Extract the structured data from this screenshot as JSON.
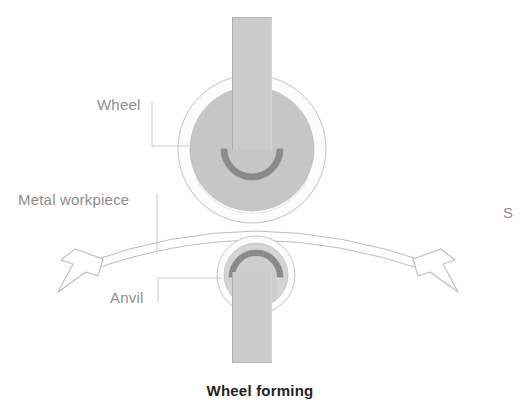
{
  "figure": {
    "caption": "Wheel forming",
    "background_color": "#ffffff"
  },
  "labels": {
    "wheel": "Wheel",
    "metal_workpiece": "Metal workpiece",
    "anvil": "Anvil",
    "cutoff_right_edge": "S"
  },
  "colors": {
    "label_text": "#8d8d8d",
    "caption_text": "#231f20",
    "outline_stroke": "#b5b5b5",
    "disc_fill": "#c6c6c6",
    "dark_ring": "#8a8a8a",
    "shaft_fill": "#cbcbcb",
    "shaft_edge": "#b0b0b0",
    "halo_fill": "#fbfbfb",
    "workpiece_fill": "#ffffff",
    "arrow_fill": "#ffffff"
  },
  "parts": [
    {
      "name": "wheel",
      "type": "roller",
      "center": [
        252,
        149
      ],
      "outer_radius": 74,
      "disc_radius": 62,
      "hub_ring_outer_radius": 31,
      "hub_ring_inner_radius": 25,
      "hub_ring_opening": "top",
      "shaft": {
        "x": 232,
        "y_top": 17,
        "width": 40,
        "y_bottom": 149
      }
    },
    {
      "name": "anvil",
      "type": "roller",
      "center": [
        256,
        275
      ],
      "outer_radius": 39,
      "disc_radius": 32,
      "hub_ring_outer_radius": 27,
      "hub_ring_inner_radius": 21,
      "hub_ring_opening": "bottom",
      "shaft": {
        "x": 232,
        "y_top": 275,
        "width": 40,
        "y_bottom": 363
      }
    },
    {
      "name": "metal-workpiece",
      "type": "curved-strip",
      "left_end": [
        84,
        262
      ],
      "apex": [
        256,
        232
      ],
      "right_end": [
        432,
        262
      ],
      "thickness": 9
    },
    {
      "name": "arrow-left",
      "type": "outline-arrow",
      "direction": "down-left",
      "tip": [
        58,
        285
      ]
    },
    {
      "name": "arrow-right",
      "type": "outline-arrow",
      "direction": "down-right",
      "tip": [
        458,
        285
      ]
    }
  ],
  "leaders": [
    {
      "name": "wheel-leader",
      "path": "L-shape from label right edge up to vertical, across to wheel outer circle",
      "points": [
        [
          152,
          102
        ],
        [
          152,
          146
        ],
        [
          188,
          146
        ]
      ]
    },
    {
      "name": "workpiece-leader",
      "path": "vertical from label down to workpiece arc",
      "points": [
        [
          157,
          197
        ],
        [
          157,
          253
        ]
      ]
    },
    {
      "name": "anvil-leader",
      "path": "L-shape from label up then right to anvil",
      "points": [
        [
          158,
          299
        ],
        [
          158,
          278
        ],
        [
          222,
          278
        ]
      ]
    }
  ]
}
